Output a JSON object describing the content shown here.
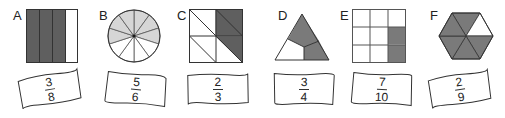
{
  "figures": [
    {
      "letter": "A",
      "shape": "square-4-vertical-strips",
      "parts": 4,
      "shaded": 3,
      "label": {
        "numerator": "3",
        "denominator": "8"
      }
    },
    {
      "letter": "B",
      "shape": "circle-10-sectors",
      "parts": 10,
      "shaded": 6,
      "label": {
        "numerator": "5",
        "denominator": "6"
      }
    },
    {
      "letter": "C",
      "shape": "square-8-triangles",
      "parts": 8,
      "shaded": 3,
      "label": {
        "numerator": "2",
        "denominator": "3"
      }
    },
    {
      "letter": "D",
      "shape": "triangle-3-parts",
      "parts": 3,
      "shaded": 2,
      "label": {
        "numerator": "3",
        "denominator": "4"
      }
    },
    {
      "letter": "E",
      "shape": "square-3x3-grid",
      "parts": 9,
      "shaded": 2,
      "label": {
        "numerator": "7",
        "denominator": "10"
      }
    },
    {
      "letter": "F",
      "shape": "hexagon-6-triangles",
      "parts": 6,
      "shaded": 5,
      "label": {
        "numerator": "2",
        "denominator": "9"
      }
    }
  ],
  "colors": {
    "dark_shade": "#5f5f5f",
    "light_shade": "#d6d6d6",
    "mid_shade": "#7a7a7a",
    "outline": "#333333"
  }
}
